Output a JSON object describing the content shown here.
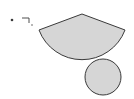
{
  "diagram": {
    "colors": {
      "fill": "#d6d6d6",
      "stroke": "#3a3a3a",
      "background": "#ffffff"
    },
    "sector": {
      "vertex": [
        82,
        14
      ],
      "radius": 46,
      "left_end": [
        39,
        30
      ],
      "right_end": [
        125,
        30
      ]
    },
    "circle": {
      "center": [
        103,
        77
      ],
      "radius": 18
    },
    "markers": {
      "dot": [
        12,
        20
      ],
      "bracket": {
        "from": [
          22,
          18
        ],
        "corner": [
          29,
          18
        ],
        "to": [
          29,
          23
        ]
      },
      "small_dot": [
        32,
        25
      ]
    }
  }
}
